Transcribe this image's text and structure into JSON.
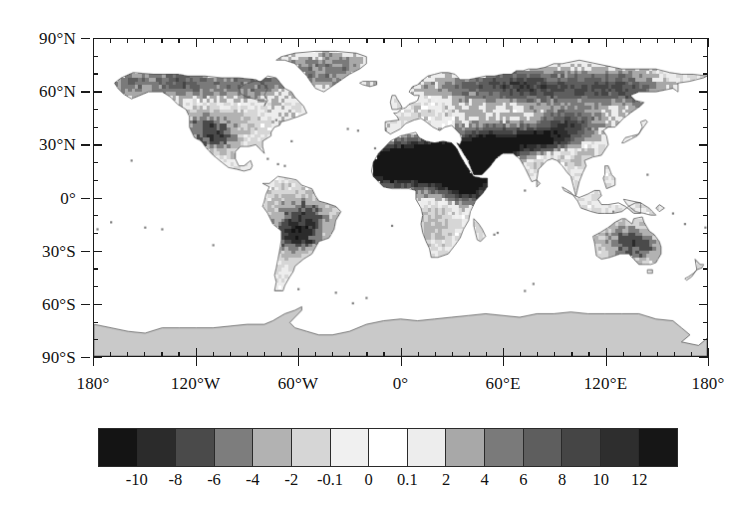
{
  "figure": {
    "type": "global-anomaly-map",
    "projection": "equirectangular",
    "background_color": "#ffffff",
    "frame_color": "#1a1a1a"
  },
  "axes": {
    "x": {
      "label": "",
      "range_deg": [
        -180,
        180
      ],
      "major_ticks": [
        {
          "value": -180,
          "label": "180°"
        },
        {
          "value": -120,
          "label": "120°W"
        },
        {
          "value": -60,
          "label": "60°W"
        },
        {
          "value": 0,
          "label": "0°"
        },
        {
          "value": 60,
          "label": "60°E"
        },
        {
          "value": 120,
          "label": "120°E"
        },
        {
          "value": 180,
          "label": "180°"
        }
      ],
      "minor_tick_step_deg": 10
    },
    "y": {
      "label": "",
      "range_deg": [
        -90,
        90
      ],
      "major_ticks": [
        {
          "value": 90,
          "label": "90°N"
        },
        {
          "value": 60,
          "label": "60°N"
        },
        {
          "value": 30,
          "label": "30°N"
        },
        {
          "value": 0,
          "label": "0°"
        },
        {
          "value": -30,
          "label": "30°S"
        },
        {
          "value": -60,
          "label": "60°S"
        },
        {
          "value": -90,
          "label": "90°S"
        }
      ],
      "minor_tick_step_deg": 10
    }
  },
  "colorbar": {
    "orientation": "horizontal",
    "boundaries": [
      -10,
      -8,
      -6,
      -4,
      -2,
      -0.1,
      0,
      0.1,
      2,
      4,
      6,
      8,
      10,
      12
    ],
    "tick_labels": [
      "-10",
      "-8",
      "-6",
      "-4",
      "-2",
      "-0.1",
      "0",
      "0.1",
      "2",
      "4",
      "6",
      "8",
      "10",
      "12"
    ],
    "n_cells": 15,
    "cell_colors": [
      "#141414",
      "#2b2b2b",
      "#4a4a4a",
      "#7d7d7d",
      "#b2b2b2",
      "#d6d6d6",
      "#f0f0f0",
      "#ffffff",
      "#ededed",
      "#a8a8a8",
      "#7a7a7a",
      "#5e5e5e",
      "#454545",
      "#2e2e2e",
      "#161616"
    ],
    "extend_low": true,
    "extend_high": true
  },
  "chart_data": {
    "type": "heatmap",
    "title": "",
    "subtitle": "",
    "xlabel": "",
    "ylabel": "",
    "xlim": [
      -180,
      180
    ],
    "ylim": [
      -90,
      90
    ],
    "grid": false,
    "legend": "colorbar-below",
    "colormap": "grayscale-diverging-15-level",
    "value_breaks": [
      -10,
      -8,
      -6,
      -4,
      -2,
      -0.1,
      0,
      0.1,
      2,
      4,
      6,
      8,
      10,
      12
    ],
    "xtick_labels": [
      "180°",
      "120°W",
      "60°W",
      "0°",
      "60°E",
      "120°E",
      "180°"
    ],
    "ytick_labels": [
      "90°N",
      "60°N",
      "30°N",
      "0°",
      "30°S",
      "60°S",
      "90°S"
    ],
    "ocean_value": null,
    "ocean_color": "#ffffff",
    "antarctica_value": null,
    "antarctica_color": "#c9c9c9",
    "annotations": [
      {
        "region": "Sahara / Sahel",
        "lon": 15,
        "lat": 20,
        "value": 12,
        "note": "largest positive anomalies, near-black"
      },
      {
        "region": "Arabian Peninsula",
        "lon": 46,
        "lat": 22,
        "value": 10,
        "note": "strong positive"
      },
      {
        "region": "Horn of Africa",
        "lon": 40,
        "lat": 6,
        "value": 10,
        "note": "strong positive"
      },
      {
        "region": "Central Siberia",
        "lon": 95,
        "lat": 62,
        "value": 6,
        "note": "moderate positive band"
      },
      {
        "region": "Tibetan Plateau",
        "lon": 88,
        "lat": 33,
        "value": 8,
        "note": "strong positive"
      },
      {
        "region": "Northern Canada / Alaska",
        "lon": -120,
        "lat": 65,
        "value": 6,
        "note": "moderate positive"
      },
      {
        "region": "Greenland margin",
        "lon": -42,
        "lat": 72,
        "value": 4,
        "note": "moderate positive"
      },
      {
        "region": "Gran Chaco, South America",
        "lon": -61,
        "lat": -22,
        "value": -6,
        "note": "pronounced negative"
      },
      {
        "region": "Amazon Basin",
        "lon": -62,
        "lat": -5,
        "value": -2,
        "note": "weak negative"
      },
      {
        "region": "Central Australia",
        "lon": 134,
        "lat": -24,
        "value": -4,
        "note": "moderate negative"
      },
      {
        "region": "Western United States",
        "lon": -112,
        "lat": 40,
        "value": -4,
        "note": "moderate negative"
      },
      {
        "region": "Eastern Europe",
        "lon": 30,
        "lat": 52,
        "value": 0,
        "note": "near zero"
      },
      {
        "region": "Antarctica",
        "lon": 0,
        "lat": -82,
        "value": null,
        "note": "no data, flat gray fill"
      },
      {
        "region": "Oceans",
        "lon": 0,
        "lat": -40,
        "value": null,
        "note": "masked, white"
      }
    ]
  }
}
